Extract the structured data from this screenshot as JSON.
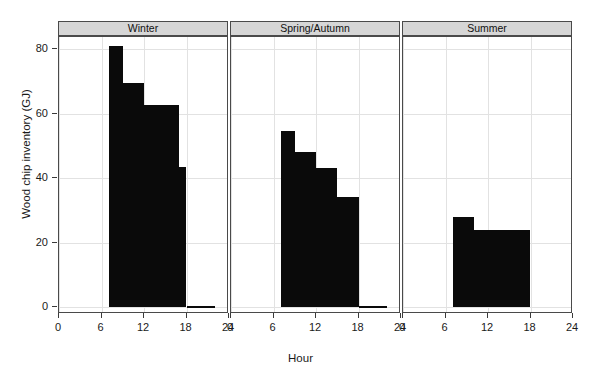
{
  "chart_data": {
    "type": "bar",
    "title": "",
    "xlabel": "Hour",
    "ylabel": "Wood chip inventory (GJ)",
    "xlim": [
      0,
      24
    ],
    "ylim": [
      -2,
      85
    ],
    "xticks": [
      0,
      6,
      12,
      18,
      24
    ],
    "yticks": [
      0,
      20,
      40,
      60,
      80
    ],
    "grid": true,
    "legend": "none",
    "panel_layout": "3 columns, shared y axis",
    "panels": [
      {
        "label": "Winter",
        "bars": [
          {
            "x_start": 7,
            "x_end": 9,
            "value": 81.0
          },
          {
            "x_start": 9,
            "x_end": 12,
            "value": 69.5
          },
          {
            "x_start": 12,
            "x_end": 17,
            "value": 62.5
          },
          {
            "x_start": 17,
            "x_end": 18,
            "value": 43.5
          },
          {
            "x_start": 18,
            "x_end": 22,
            "value": 0.3
          }
        ]
      },
      {
        "label": "Spring/Autumn",
        "bars": [
          {
            "x_start": 7,
            "x_end": 9,
            "value": 54.5
          },
          {
            "x_start": 9,
            "x_end": 12,
            "value": 48.0
          },
          {
            "x_start": 12,
            "x_end": 15,
            "value": 43.0
          },
          {
            "x_start": 15,
            "x_end": 18,
            "value": 34.0
          },
          {
            "x_start": 18,
            "x_end": 22,
            "value": 0.3
          }
        ]
      },
      {
        "label": "Summer",
        "bars": [
          {
            "x_start": 7,
            "x_end": 10,
            "value": 28.0
          },
          {
            "x_start": 10,
            "x_end": 18,
            "value": 24.0
          }
        ]
      }
    ]
  },
  "axis": {
    "y_title": "Wood chip inventory (GJ)",
    "x_title": "Hour",
    "y_tick_labels": [
      "0",
      "20",
      "40",
      "60",
      "80"
    ],
    "x_tick_labels": [
      "0",
      "6",
      "12",
      "18",
      "24"
    ]
  },
  "panel_titles": [
    "Winter",
    "Spring/Autumn",
    "Summer"
  ],
  "colors": {
    "bar": "#0a0a0a",
    "strip_background": "#d6d6d6",
    "panel_border": "#4a4a4a",
    "grid": "#e2e2e2",
    "text": "#1a1a1a",
    "background": "#ffffff"
  }
}
